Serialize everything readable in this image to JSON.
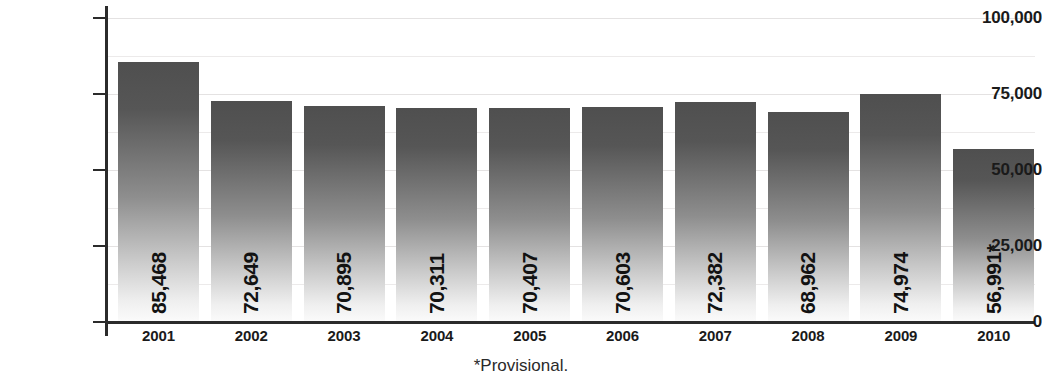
{
  "chart_data": {
    "type": "bar",
    "title": "",
    "subtitle": "",
    "xlabel": "",
    "ylabel": "",
    "categories": [
      "2001",
      "2002",
      "2003",
      "2004",
      "2005",
      "2006",
      "2007",
      "2008",
      "2009",
      "2010"
    ],
    "values": [
      85468,
      72649,
      70895,
      70311,
      70407,
      70603,
      72382,
      68962,
      74974,
      56991
    ],
    "value_labels": [
      "85,468",
      "72,649",
      "70,895",
      "70,311",
      "70,407",
      "70,603",
      "72,382",
      "68,962",
      "74,974",
      "56,991*"
    ],
    "ylim": [
      0,
      100000
    ],
    "ytick_values": [
      0,
      25000,
      50000,
      75000,
      100000
    ],
    "ytick_labels": [
      "0",
      "25,000",
      "50,000",
      "75,000",
      "100,000"
    ],
    "minor_gridline_values": [
      12500,
      37500,
      62500,
      87500
    ],
    "grid": true,
    "legend": null,
    "annotations": [
      "*Provisional."
    ],
    "series": [
      {
        "name": "",
        "values": [
          85468,
          72649,
          70895,
          70311,
          70407,
          70603,
          72382,
          68962,
          74974,
          56991
        ]
      }
    ],
    "colors": {
      "bar_top": "#4f4f4f",
      "bar_bottom": "#fbfbfb",
      "axis": "#2b2b2b",
      "text": "#1a1a1a",
      "gridline": "#eceaea",
      "background": "#ffffff"
    }
  },
  "footnote": {
    "text": "*Provisional."
  }
}
